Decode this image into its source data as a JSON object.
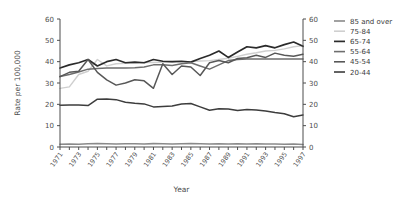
{
  "chart_data": {
    "type": "line",
    "title": "",
    "xlabel": "Year",
    "ylabel": "Rate per 100,000",
    "xlim": [
      1971,
      1997
    ],
    "ylim": [
      0,
      60
    ],
    "ytick_labels": [
      "0",
      "10",
      "20",
      "30",
      "40",
      "50",
      "60"
    ],
    "ytick_values": [
      0,
      10,
      20,
      30,
      40,
      50,
      60
    ],
    "right_axis": true,
    "right_ytick_labels": [
      "0",
      "10",
      "20",
      "30",
      "40",
      "50",
      "60"
    ],
    "grid": false,
    "legend_position": "right",
    "x": [
      1971,
      1972,
      1973,
      1974,
      1975,
      1976,
      1977,
      1978,
      1979,
      1980,
      1981,
      1982,
      1983,
      1984,
      1985,
      1986,
      1987,
      1988,
      1989,
      1990,
      1991,
      1992,
      1993,
      1994,
      1995,
      1996,
      1997
    ],
    "xtick_labels": [
      "1971",
      "1973",
      "1975",
      "1977",
      "1979",
      "1981",
      "1983",
      "1985",
      "1987",
      "1989",
      "1991",
      "1993",
      "1995",
      "1997"
    ],
    "xtick_values": [
      1971,
      1973,
      1975,
      1977,
      1979,
      1981,
      1983,
      1985,
      1987,
      1989,
      1991,
      1993,
      1995,
      1997
    ],
    "series": [
      {
        "name": "85 and over",
        "color": "#8a8a8a",
        "width": 1.6,
        "values": [
          1.3,
          1.4,
          1.3,
          1.5,
          1.6,
          1.5,
          1.4,
          1.5,
          1.5,
          1.4,
          1.6,
          1.5,
          1.4,
          1.5,
          1.6,
          1.5,
          1.4,
          1.5,
          1.4,
          1.5,
          1.4,
          1.5,
          1.4,
          1.4,
          1.3,
          1.4,
          1.2
        ]
      },
      {
        "name": "75-84",
        "color": "#cfcfcf",
        "width": 1.4,
        "values": [
          27.5,
          28.2,
          34.0,
          35.5,
          41.0,
          38.0,
          39.0,
          39.2,
          39.4,
          39.6,
          39.6,
          39.7,
          39.8,
          39.9,
          40.0,
          40.3,
          40.5,
          41.0,
          41.6,
          42.5,
          43.5,
          44.2,
          45.0,
          45.3,
          46.0,
          47.0,
          47.5
        ]
      },
      {
        "name": "65-74",
        "color": "#2b2b2b",
        "width": 1.7,
        "values": [
          37.0,
          38.5,
          39.5,
          41.0,
          38.0,
          40.0,
          41.0,
          39.5,
          39.8,
          39.5,
          41.0,
          40.2,
          40.0,
          40.2,
          39.8,
          41.5,
          43.0,
          45.0,
          42.0,
          44.5,
          47.0,
          46.5,
          47.5,
          46.5,
          48.0,
          49.2,
          47.2
        ]
      },
      {
        "name": "55-64",
        "color": "#6e6e6e",
        "width": 1.5,
        "values": [
          33.0,
          34.0,
          35.2,
          36.5,
          36.8,
          37.0,
          37.0,
          37.0,
          37.2,
          37.5,
          38.5,
          38.5,
          38.2,
          39.0,
          39.5,
          38.0,
          36.5,
          38.5,
          40.5,
          41.0,
          41.2,
          41.3,
          41.2,
          41.3,
          41.2,
          41.3,
          41.3
        ]
      },
      {
        "name": "45-54",
        "color": "#585858",
        "width": 1.5,
        "values": [
          33.0,
          35.0,
          35.5,
          41.0,
          35.0,
          31.5,
          29.0,
          30.0,
          31.5,
          31.0,
          27.5,
          39.0,
          34.0,
          38.0,
          37.5,
          33.5,
          39.5,
          40.5,
          39.5,
          41.5,
          41.8,
          43.0,
          42.0,
          44.0,
          43.0,
          42.5,
          43.5
        ]
      },
      {
        "name": "20-44",
        "color": "#3d3d3d",
        "width": 1.5,
        "values": [
          19.6,
          19.7,
          19.7,
          19.4,
          22.4,
          22.5,
          22.2,
          21.0,
          20.5,
          20.2,
          18.8,
          19.0,
          19.2,
          20.2,
          20.4,
          18.8,
          17.2,
          17.9,
          17.8,
          17.1,
          17.6,
          17.4,
          16.9,
          16.2,
          15.6,
          14.2,
          15.0
        ]
      }
    ],
    "legend_entries": [
      "85 and over",
      "75-84",
      "65-74",
      "55-64",
      "45-54",
      "20-44"
    ]
  }
}
